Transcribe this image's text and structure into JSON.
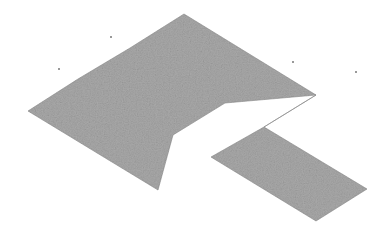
{
  "canvas": {
    "width": 386,
    "height": 239,
    "background_color": "#ffffff",
    "description": "Isometric projection of a flat plus/pinwheel-shaped slab rendered as a noisy gray silhouette on a white background"
  },
  "figure": {
    "name": "isometric-polygon",
    "fill_color": "#a9a9a9",
    "fill_color_light": "#bdbdbd",
    "fill_color_dark": "#9a9a9a",
    "edge_color": "#8c8c8c",
    "texture": "speckled-noise",
    "outline_path": "M 184,14 L 316,95 L 264,127 L 211,157 L 316,221 L 367,189 L 264,127 L 316,95 L 225,103 L 173,135 L 158,190 L 28,111 L 78,79 L 130,48 Z",
    "vertices": [
      {
        "name": "top-apex",
        "x": 184,
        "y": 14
      },
      {
        "name": "top-band-left-corner",
        "x": 130,
        "y": 48
      },
      {
        "name": "top-band-right-tip",
        "x": 316,
        "y": 95
      },
      {
        "name": "notch-right-corner",
        "x": 225,
        "y": 103
      },
      {
        "name": "notch-bottom-corner",
        "x": 173,
        "y": 135
      },
      {
        "name": "left-arm-top-corner",
        "x": 78,
        "y": 79
      },
      {
        "name": "left-arm-left-tip",
        "x": 28,
        "y": 111
      },
      {
        "name": "left-arm-bottom-corner",
        "x": 158,
        "y": 190
      },
      {
        "name": "inner-v-corner",
        "x": 211,
        "y": 157
      },
      {
        "name": "right-arm-bottom-corner",
        "x": 316,
        "y": 221
      },
      {
        "name": "right-arm-right-tip",
        "x": 367,
        "y": 189
      },
      {
        "name": "mid-junction",
        "x": 264,
        "y": 127
      }
    ]
  },
  "specks": [
    {
      "name": "speck-1",
      "x": 110,
      "y": 36
    },
    {
      "name": "speck-2",
      "x": 58,
      "y": 68
    },
    {
      "name": "speck-3",
      "x": 292,
      "y": 61
    },
    {
      "name": "speck-4",
      "x": 355,
      "y": 71
    }
  ]
}
